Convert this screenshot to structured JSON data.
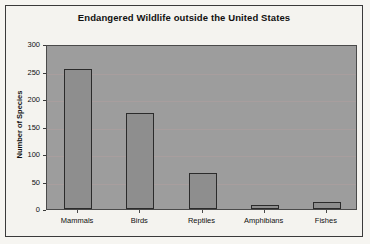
{
  "chart_data": {
    "type": "bar",
    "title": "Endangered Wildlife outside the United States",
    "xlabel": "",
    "ylabel": "Number of Species",
    "categories": [
      "Mammals",
      "Birds",
      "Reptiles",
      "Amphibians",
      "Fishes"
    ],
    "values": [
      255,
      175,
      65,
      8,
      12
    ],
    "ylim": [
      0,
      300
    ],
    "yticks": [
      0,
      50,
      100,
      150,
      200,
      250,
      300
    ],
    "ytick_labels": [
      "0",
      "50",
      "100",
      "150",
      "200",
      "250",
      "300"
    ],
    "grid": true,
    "legend": false,
    "colors": {
      "bar_fill": "#8e8e8e",
      "bar_edge": "#2b2b2b",
      "plot_background": "#9d9d9d",
      "figure_background": "#f4f3ef",
      "text": "#101010",
      "gridline": "#b6a0a0"
    }
  }
}
